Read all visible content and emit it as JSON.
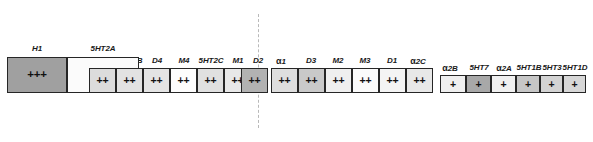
{
  "figure": {
    "type": "receptor-binding-affinity-bar-diagram",
    "width": 593,
    "height": 142,
    "background": "#ffffff",
    "divider": {
      "x": 258,
      "style": "dashed",
      "color": "#b9b9b9"
    },
    "bottom_text_fragment": "",
    "tiers": [
      {
        "key": "t3",
        "symbol": "+++",
        "label": "high affinity"
      },
      {
        "key": "t2",
        "symbol": "++",
        "label": "moderate affinity"
      },
      {
        "key": "t1",
        "symbol": "+",
        "label": "low affinity"
      }
    ]
  },
  "receptors": [
    {
      "name": "H1",
      "alpha": false,
      "affinity": "+++",
      "tier": "t3",
      "x": 7,
      "y": 57,
      "w": 60,
      "h": 36,
      "fill": "#a0a0a0"
    },
    {
      "name": "5HT2A",
      "alpha": false,
      "affinity": "+++",
      "tier": "t3",
      "x": 67,
      "y": 57,
      "w": 72,
      "h": 36,
      "fill": "#fbfbfb"
    },
    {
      "name": "5HT6",
      "alpha": false,
      "affinity": "++",
      "tier": "t2",
      "x": 89,
      "y": 68,
      "w": 27,
      "h": 25,
      "fill": "#dcdcdc"
    },
    {
      "name": "5HT2B",
      "alpha": false,
      "affinity": "++",
      "tier": "t2",
      "x": 116,
      "y": 68,
      "w": 27,
      "h": 25,
      "fill": "#e2e2e2"
    },
    {
      "name": "D4",
      "alpha": false,
      "affinity": "++",
      "tier": "t2",
      "x": 143,
      "y": 68,
      "w": 27,
      "h": 25,
      "fill": "#e4e4e4"
    },
    {
      "name": "M4",
      "alpha": false,
      "affinity": "++",
      "tier": "t2",
      "x": 170,
      "y": 68,
      "w": 27,
      "h": 25,
      "fill": "#fdfdfd"
    },
    {
      "name": "5HT2C",
      "alpha": false,
      "affinity": "++",
      "tier": "t2",
      "x": 197,
      "y": 68,
      "w": 27,
      "h": 25,
      "fill": "#e0e0e0"
    },
    {
      "name": "M1",
      "alpha": false,
      "affinity": "++",
      "tier": "t2",
      "x": 224,
      "y": 68,
      "w": 27,
      "h": 25,
      "fill": "#e8e8e8"
    },
    {
      "name": "D2",
      "alpha": false,
      "affinity": "++",
      "tier": "t2",
      "x": 241,
      "y": 68,
      "w": 27,
      "h": 25,
      "fill": "#b2b2b2"
    },
    {
      "name": "1",
      "alpha": true,
      "affinity": "++",
      "tier": "t2",
      "x": 271,
      "y": 68,
      "w": 27,
      "h": 25,
      "fill": "#dedede"
    },
    {
      "name": "D3",
      "alpha": false,
      "affinity": "++",
      "tier": "t2",
      "x": 298,
      "y": 68,
      "w": 27,
      "h": 25,
      "fill": "#c9c9c9"
    },
    {
      "name": "M2",
      "alpha": false,
      "affinity": "++",
      "tier": "t2",
      "x": 325,
      "y": 68,
      "w": 27,
      "h": 25,
      "fill": "#efefef"
    },
    {
      "name": "M3",
      "alpha": false,
      "affinity": "++",
      "tier": "t2",
      "x": 352,
      "y": 68,
      "w": 27,
      "h": 25,
      "fill": "#fbfbfb"
    },
    {
      "name": "D1",
      "alpha": false,
      "affinity": "++",
      "tier": "t2",
      "x": 379,
      "y": 68,
      "w": 27,
      "h": 25,
      "fill": "#f4f4f4"
    },
    {
      "name": "2C",
      "alpha": true,
      "affinity": "++",
      "tier": "t2",
      "x": 406,
      "y": 68,
      "w": 27,
      "h": 25,
      "fill": "#e8e8e8"
    },
    {
      "name": "2B",
      "alpha": true,
      "affinity": "+",
      "tier": "t1",
      "x": 440,
      "y": 75,
      "w": 26,
      "h": 18,
      "fill": "#efefef"
    },
    {
      "name": "5HT7",
      "alpha": false,
      "affinity": "+",
      "tier": "t1",
      "x": 466,
      "y": 75,
      "w": 25,
      "h": 18,
      "fill": "#a8a8a8"
    },
    {
      "name": "2A",
      "alpha": true,
      "affinity": "+",
      "tier": "t1",
      "x": 491,
      "y": 75,
      "w": 25,
      "h": 18,
      "fill": "#f0f0f0"
    },
    {
      "name": "5HT1B",
      "alpha": false,
      "affinity": "+",
      "tier": "t1",
      "x": 516,
      "y": 75,
      "w": 24,
      "h": 18,
      "fill": "#c6c6c6"
    },
    {
      "name": "5HT3",
      "alpha": false,
      "affinity": "+",
      "tier": "t1",
      "x": 540,
      "y": 75,
      "w": 23,
      "h": 18,
      "fill": "#d3d3d3"
    },
    {
      "name": "5HT1D",
      "alpha": false,
      "affinity": "+",
      "tier": "t1",
      "x": 563,
      "y": 75,
      "w": 23,
      "h": 18,
      "fill": "#d7d7d7"
    }
  ],
  "labels": [
    {
      "text": "H1",
      "alpha": false,
      "cx": 37,
      "y": 44
    },
    {
      "text": "5HT2A",
      "alpha": false,
      "cx": 103,
      "y": 44
    },
    {
      "text": "5HT6",
      "alpha": false,
      "cx": 102,
      "y": 56
    },
    {
      "text": "5HT2B",
      "alpha": false,
      "cx": 130,
      "y": 56
    },
    {
      "text": "D4",
      "alpha": false,
      "cx": 157,
      "y": 56
    },
    {
      "text": "M4",
      "alpha": false,
      "cx": 184,
      "y": 56
    },
    {
      "text": "5HT2C",
      "alpha": false,
      "cx": 211,
      "y": 56
    },
    {
      "text": "M1",
      "alpha": false,
      "cx": 238,
      "y": 56
    },
    {
      "text": "D2",
      "alpha": false,
      "cx": 258,
      "y": 56
    },
    {
      "text": "1",
      "alpha": true,
      "cx": 281,
      "y": 56
    },
    {
      "text": "D3",
      "alpha": false,
      "cx": 311,
      "y": 56
    },
    {
      "text": "M2",
      "alpha": false,
      "cx": 338,
      "y": 56
    },
    {
      "text": "M3",
      "alpha": false,
      "cx": 365,
      "y": 56
    },
    {
      "text": "D1",
      "alpha": false,
      "cx": 392,
      "y": 56
    },
    {
      "text": "2C",
      "alpha": true,
      "cx": 418,
      "y": 56
    },
    {
      "text": "2B",
      "alpha": true,
      "cx": 450,
      "y": 63
    },
    {
      "text": "5HT7",
      "alpha": false,
      "cx": 479,
      "y": 63
    },
    {
      "text": "2A",
      "alpha": true,
      "cx": 504,
      "y": 63
    },
    {
      "text": "5HT1B",
      "alpha": false,
      "cx": 529,
      "y": 63
    },
    {
      "text": "5HT3",
      "alpha": false,
      "cx": 552,
      "y": 63
    },
    {
      "text": "5HT1D",
      "alpha": false,
      "cx": 575,
      "y": 63
    }
  ]
}
